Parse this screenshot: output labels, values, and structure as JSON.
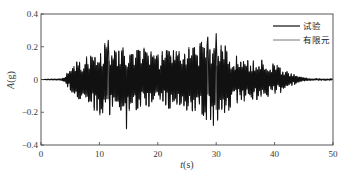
{
  "chart_data": {
    "type": "line",
    "title": "",
    "xlabel": "t(s)",
    "xlabel_var": "t",
    "xlabel_unit": "(s)",
    "ylabel": "A(g)",
    "ylabel_var": "A",
    "ylabel_unit": "(g)",
    "xlim": [
      0,
      50
    ],
    "ylim": [
      -0.4,
      0.4
    ],
    "xticks": [
      0,
      10,
      20,
      30,
      40,
      50
    ],
    "xtick_labels": [
      "0",
      "10",
      "20",
      "30",
      "40",
      "50"
    ],
    "yticks": [
      0.4,
      0.2,
      0,
      -0.2,
      -0.4
    ],
    "ytick_labels": [
      "0.4",
      "0.2",
      "0",
      "-0.2",
      "-0.4"
    ],
    "grid": false,
    "legend_position": "upper right",
    "series": [
      {
        "name": "试验",
        "color": "#111111",
        "line_width": 1.1,
        "envelope": {
          "t": [
            0,
            3.5,
            4.5,
            5.5,
            7,
            9,
            12,
            15,
            20,
            25,
            28,
            30,
            33,
            36,
            40,
            42,
            44,
            46,
            50
          ],
          "amp": [
            0.0,
            0.005,
            0.04,
            0.1,
            0.13,
            0.2,
            0.22,
            0.2,
            0.17,
            0.2,
            0.25,
            0.26,
            0.16,
            0.13,
            0.1,
            0.06,
            0.02,
            0.006,
            0.004
          ]
        },
        "peaks_annotated": [
          {
            "t": 11.5,
            "value": 0.24
          },
          {
            "t": 14.6,
            "value": -0.3
          },
          {
            "t": 28.5,
            "value": 0.26
          },
          {
            "t": 30.0,
            "value": 0.28
          },
          {
            "t": 29.5,
            "value": -0.28
          }
        ]
      },
      {
        "name": "有限元",
        "color": "#555555",
        "line_width": 0.8,
        "envelope": {
          "t": [
            0,
            3.5,
            4.5,
            5.5,
            7,
            9,
            12,
            15,
            20,
            25,
            28,
            30,
            33,
            36,
            40,
            42,
            44,
            46,
            50
          ],
          "amp": [
            0.0,
            0.004,
            0.035,
            0.09,
            0.12,
            0.19,
            0.21,
            0.19,
            0.16,
            0.19,
            0.23,
            0.24,
            0.15,
            0.12,
            0.09,
            0.055,
            0.02,
            0.006,
            0.004
          ]
        }
      }
    ],
    "sampling": {
      "dt": 0.12
    }
  },
  "legend": {
    "items": [
      {
        "label": "试验"
      },
      {
        "label": "有限元"
      }
    ]
  }
}
